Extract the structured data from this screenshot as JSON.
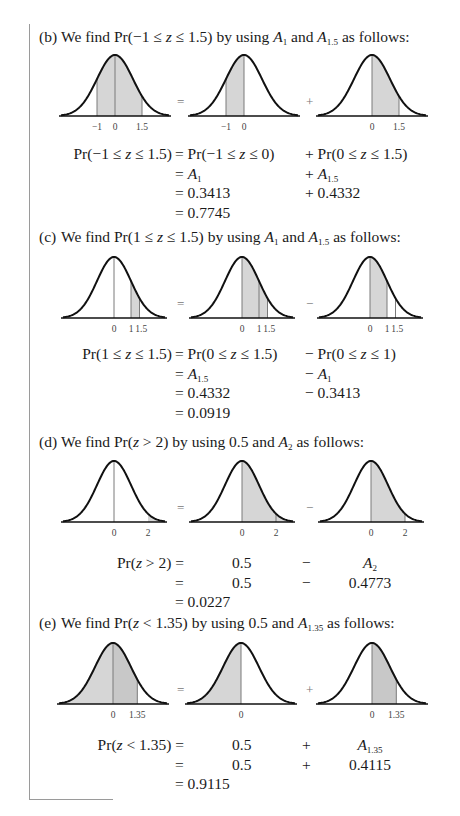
{
  "parts": [
    {
      "id": "b",
      "label": "(b)",
      "heading_pre": "We find Pr(−1 ≤ ",
      "heading_var": "z",
      "heading_mid": " ≤ 1.5) by using ",
      "terms": [
        {
          "sym": "A",
          "sub": "1"
        },
        {
          "sym": "A",
          "sub": "1.5"
        }
      ],
      "heading_join": " and ",
      "heading_post": " as follows:",
      "heading_top": 28,
      "fig_top": 50,
      "baseline_y": 66,
      "peak_h": 61,
      "operators": [
        "=",
        "+"
      ],
      "panels": [
        {
          "cx": 115,
          "sigma": 18,
          "shade": [
            [
              -1,
              1.5
            ]
          ],
          "lines": [
            -1,
            0,
            1.5
          ],
          "ticks": [
            "-1",
            "0",
            "1.5"
          ],
          "tick_x": [
            -1,
            0,
            1.5
          ]
        },
        {
          "cx": 244,
          "sigma": 18,
          "shade": [
            [
              -1,
              0
            ]
          ],
          "lines": [
            -1,
            0
          ],
          "ticks": [
            "-1",
            "0"
          ],
          "tick_x": [
            -1,
            0
          ]
        },
        {
          "cx": 372,
          "sigma": 18,
          "shade": [
            [
              0,
              1.5
            ]
          ],
          "lines": [
            0,
            1.5
          ],
          "ticks": [
            "0",
            "1.5"
          ],
          "tick_x": [
            0,
            1.5
          ]
        }
      ],
      "equation_top": 145,
      "equation": [
        {
          "lhs": "Pr(−1 ≤ z ≤ 1.5)",
          "mid": "= Pr(−1 ≤ z ≤ 0)",
          "right": "+ Pr(0 ≤ z ≤ 1.5)"
        },
        {
          "lhs": "",
          "mid": "= A_1",
          "right": "+ A_1.5"
        },
        {
          "lhs": "",
          "mid": "= 0.3413",
          "right": "+ 0.4332"
        },
        {
          "lhs": "",
          "mid": "= 0.7745",
          "right": ""
        }
      ]
    },
    {
      "id": "c",
      "label": "(c)",
      "heading_pre": "We find Pr(1 ≤ ",
      "heading_var": "z",
      "heading_mid": " ≤ 1.5) by using ",
      "terms": [
        {
          "sym": "A",
          "sub": "1"
        },
        {
          "sym": "A",
          "sub": "1.5"
        }
      ],
      "heading_join": " and ",
      "heading_post": " as follows:",
      "heading_top": 228,
      "fig_top": 252,
      "baseline_y": 66,
      "peak_h": 61,
      "operators": [
        "=",
        "−"
      ],
      "panels": [
        {
          "cx": 114,
          "sigma": 17,
          "shade": [
            [
              1,
              1.5
            ]
          ],
          "lines": [
            0,
            1,
            1.5
          ],
          "ticks": [
            "0",
            "1",
            "1.5"
          ],
          "tick_x": [
            0,
            1,
            1.6
          ]
        },
        {
          "cx": 242,
          "sigma": 17,
          "shade": [
            [
              0,
              1.5
            ]
          ],
          "lines": [
            0,
            1,
            1.5
          ],
          "ticks": [
            "0",
            "1",
            "1.5"
          ],
          "tick_x": [
            0,
            1,
            1.6
          ]
        },
        {
          "cx": 370,
          "sigma": 17,
          "shade": [
            [
              0,
              1
            ]
          ],
          "lines": [
            0,
            1,
            1.5
          ],
          "ticks": [
            "0",
            "1",
            "1.5"
          ],
          "tick_x": [
            0,
            1,
            1.6
          ]
        }
      ],
      "equation_top": 345,
      "equation": [
        {
          "lhs": "Pr(1 ≤ z ≤ 1.5)",
          "mid": "= Pr(0 ≤ z ≤ 1.5)",
          "right": "− Pr(0 ≤ z ≤ 1)"
        },
        {
          "lhs": "",
          "mid": "= A_1.5",
          "right": "− A_1"
        },
        {
          "lhs": "",
          "mid": "= 0.4332",
          "right": "− 0.3413"
        },
        {
          "lhs": "",
          "mid": "= 0.0919",
          "right": ""
        }
      ]
    },
    {
      "id": "d",
      "label": "(d)",
      "heading_pre": "We find Pr(",
      "heading_var": "z",
      "heading_mid": " > 2) by using 0.5 and ",
      "terms": [
        {
          "sym": "A",
          "sub": "2"
        }
      ],
      "heading_join": "",
      "heading_post": " as follows:",
      "heading_top": 433,
      "fig_top": 456,
      "baseline_y": 66,
      "peak_h": 61,
      "operators": [
        "=",
        "−"
      ],
      "panels": [
        {
          "cx": 114,
          "sigma": 17,
          "shade": [
            [
              2,
              3.1
            ]
          ],
          "lines": [
            0
          ],
          "ticks": [
            "0",
            "2"
          ],
          "tick_x": [
            0,
            2
          ]
        },
        {
          "cx": 242,
          "sigma": 17,
          "shade": [
            [
              0,
              3.1
            ]
          ],
          "lines": [
            0,
            2
          ],
          "ticks": [
            "0",
            "2"
          ],
          "tick_x": [
            0,
            2
          ]
        },
        {
          "cx": 371,
          "sigma": 17,
          "shade": [
            [
              0,
              2
            ]
          ],
          "lines": [
            0,
            2
          ],
          "ticks": [
            "0",
            "2"
          ],
          "tick_x": [
            0,
            2
          ]
        }
      ],
      "equation_top": 554,
      "equation_cols": true,
      "equation": [
        {
          "lhs": "Pr(z > 2) =",
          "c1": "0.5",
          "op": "−",
          "c2": "A_2"
        },
        {
          "lhs": "=",
          "c1": "0.5",
          "op": "−",
          "c2": "0.4773"
        },
        {
          "lhs": "= 0.0227",
          "c1": "",
          "op": "",
          "c2": ""
        }
      ]
    },
    {
      "id": "e",
      "label": "(e)",
      "heading_pre": "We find Pr(",
      "heading_var": "z",
      "heading_mid": " < 1.35) by using 0.5 and ",
      "terms": [
        {
          "sym": "A",
          "sub": "1.35"
        }
      ],
      "heading_join": "",
      "heading_post": " as follows:",
      "heading_top": 614,
      "fig_top": 638,
      "baseline_y": 66,
      "peak_h": 61,
      "operators": [
        "=",
        "+"
      ],
      "panels": [
        {
          "cx": 113,
          "sigma": 18,
          "shade": [
            [
              -3.1,
              0
            ],
            [
              0,
              1.35
            ]
          ],
          "lines": [
            0,
            1.35
          ],
          "ticks": [
            "0",
            "1.35"
          ],
          "tick_x": [
            0,
            1.35
          ]
        },
        {
          "cx": 241,
          "sigma": 18,
          "shade": [
            [
              -3.1,
              0
            ]
          ],
          "lines": [
            0
          ],
          "ticks": [
            "0"
          ],
          "tick_x": [
            0
          ]
        },
        {
          "cx": 372,
          "sigma": 18,
          "shade": [
            [
              0,
              1.35
            ]
          ],
          "lines": [
            0,
            1.35
          ],
          "ticks": [
            "0",
            "1.35"
          ],
          "tick_x": [
            0,
            1.35
          ]
        }
      ],
      "equation_top": 736,
      "equation_cols": true,
      "equation": [
        {
          "lhs": "Pr(z < 1.35) =",
          "c1": "0.5",
          "op": "+",
          "c2": "A_1.35"
        },
        {
          "lhs": "=",
          "c1": "0.5",
          "op": "+",
          "c2": "0.4115"
        },
        {
          "lhs": "= 0.9115",
          "c1": "",
          "op": "",
          "c2": ""
        }
      ]
    }
  ],
  "colors": {
    "curve": "#111111",
    "shade": "#d6d6d6",
    "shade_dark": "#c8c8c8",
    "divider": "#7a7a7a",
    "frame": "#9a9a9a"
  }
}
